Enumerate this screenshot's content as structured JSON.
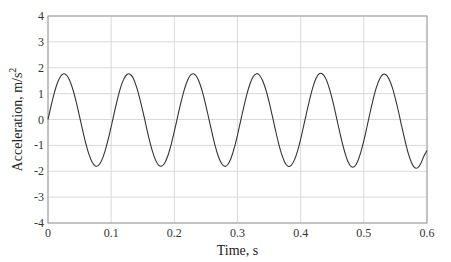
{
  "chart_data": {
    "type": "line",
    "title": "",
    "xlabel": "Time, s",
    "ylabel": "Acceleration, m/s",
    "ylabel_superscript": "2",
    "xlim": [
      0,
      0.6
    ],
    "ylim": [
      -4,
      4
    ],
    "grid": true,
    "legend": null,
    "x_ticks": [
      "0",
      "0.1",
      "0.2",
      "0.3",
      "0.4",
      "0.5",
      "0.6"
    ],
    "y_ticks": [
      "4",
      "3",
      "2",
      "1",
      "0",
      "-1",
      "-2",
      "-3",
      "-4"
    ],
    "colors": {
      "line": "#333333",
      "grid": "#d9d9d9",
      "axes": "#9a9a9a"
    },
    "series": [
      {
        "name": "acceleration",
        "x": [
          0,
          0.005,
          0.01,
          0.015,
          0.02,
          0.025,
          0.03,
          0.035,
          0.04,
          0.045,
          0.05,
          0.055,
          0.06,
          0.065,
          0.07,
          0.075,
          0.08,
          0.085,
          0.09,
          0.095,
          0.1,
          0.105,
          0.11,
          0.115,
          0.12,
          0.125,
          0.13,
          0.135,
          0.14,
          0.145,
          0.15,
          0.155,
          0.16,
          0.165,
          0.17,
          0.175,
          0.18,
          0.185,
          0.19,
          0.195,
          0.2,
          0.205,
          0.21,
          0.215,
          0.22,
          0.225,
          0.23,
          0.235,
          0.24,
          0.245,
          0.25,
          0.255,
          0.26,
          0.265,
          0.27,
          0.275,
          0.28,
          0.285,
          0.29,
          0.295,
          0.3,
          0.305,
          0.31,
          0.315,
          0.32,
          0.325,
          0.33,
          0.335,
          0.34,
          0.345,
          0.35,
          0.355,
          0.36,
          0.365,
          0.37,
          0.375,
          0.38,
          0.385,
          0.39,
          0.395,
          0.4,
          0.405,
          0.41,
          0.415,
          0.42,
          0.425,
          0.43,
          0.435,
          0.44,
          0.445,
          0.45,
          0.455,
          0.46,
          0.465,
          0.47,
          0.475,
          0.48,
          0.485,
          0.49,
          0.495,
          0.5,
          0.505,
          0.51,
          0.515,
          0.52,
          0.525,
          0.53,
          0.535,
          0.54,
          0.545,
          0.55,
          0.555,
          0.56,
          0.565,
          0.57,
          0.575,
          0.58,
          0.585,
          0.59,
          0.595,
          0.6
        ],
        "y": [
          0.0,
          0.54,
          1.03,
          1.42,
          1.67,
          1.77,
          1.7,
          1.47,
          1.11,
          0.64,
          0.11,
          -0.43,
          -0.94,
          -1.36,
          -1.65,
          -1.8,
          -1.77,
          -1.58,
          -1.24,
          -0.8,
          -0.28,
          0.27,
          0.79,
          1.24,
          1.56,
          1.74,
          1.75,
          1.59,
          1.27,
          0.84,
          0.33,
          -0.21,
          -0.74,
          -1.2,
          -1.55,
          -1.76,
          -1.8,
          -1.67,
          -1.38,
          -0.97,
          -0.46,
          0.08,
          0.61,
          1.09,
          1.46,
          1.7,
          1.77,
          1.67,
          1.41,
          1.02,
          0.53,
          -0.01,
          -0.55,
          -1.05,
          -1.45,
          -1.71,
          -1.81,
          -1.73,
          -1.48,
          -1.09,
          -0.6,
          -0.05,
          0.49,
          0.99,
          1.39,
          1.66,
          1.77,
          1.71,
          1.49,
          1.14,
          0.68,
          0.15,
          -0.4,
          -0.92,
          -1.35,
          -1.66,
          -1.81,
          -1.77,
          -1.57,
          -1.22,
          -0.76,
          -0.22,
          0.33,
          0.85,
          1.3,
          1.62,
          1.78,
          1.75,
          1.57,
          1.23,
          0.79,
          0.27,
          -0.29,
          -0.82,
          -1.28,
          -1.63,
          -1.82,
          -1.82,
          -1.63,
          -1.28,
          -0.82,
          -0.28,
          0.28,
          0.8,
          1.25,
          1.57,
          1.74,
          1.73,
          1.56,
          1.24,
          0.8,
          0.29,
          -0.27,
          -0.8,
          -1.28,
          -1.64,
          -1.85,
          -1.87,
          -1.71,
          -1.42,
          -1.2
        ]
      }
    ]
  }
}
